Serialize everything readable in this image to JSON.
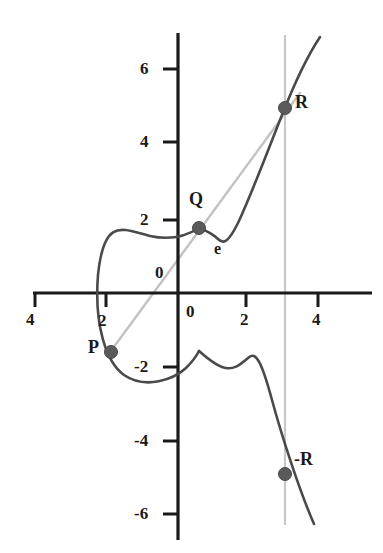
{
  "figure": {
    "kind": "elliptic-curve-point-addition-diagram",
    "background_color": "#ffffff",
    "curve_color": "#4a4a4a",
    "chord_color": "#c2c2c2",
    "vline_color": "#c8c8c8",
    "axis_color": "#1a1a1a",
    "point_color": "#5a5a5a"
  },
  "axes": {
    "x_ticks": [
      {
        "label": "4",
        "value": -4,
        "px": 35,
        "label_px": {
          "x": 26,
          "y": 311
        }
      },
      {
        "label": "2",
        "value": -2,
        "px": 106,
        "label_px": {
          "x": 98,
          "y": 312
        }
      },
      {
        "label": "0",
        "value": 0,
        "px": 178,
        "label_px": {
          "x": 186,
          "y": 303
        }
      },
      {
        "label": "2",
        "value": 2,
        "px": 246,
        "label_px": {
          "x": 240,
          "y": 311
        }
      },
      {
        "label": "4",
        "value": 4,
        "px": 318,
        "label_px": {
          "x": 312,
          "y": 311
        }
      }
    ],
    "y_ticks": [
      {
        "label": "6",
        "value": 6,
        "px": 69,
        "label_px": {
          "x": 140,
          "y": 60
        }
      },
      {
        "label": "4",
        "value": 4,
        "px": 142,
        "label_px": {
          "x": 140,
          "y": 133
        }
      },
      {
        "label": "2",
        "value": 2,
        "px": 220,
        "label_px": {
          "x": 140,
          "y": 211
        }
      },
      {
        "label": "0",
        "value": 0,
        "px": 293,
        "label_px": {
          "x": 155,
          "y": 264
        }
      },
      {
        "label": "-2",
        "value": -2,
        "px": 367,
        "label_px": {
          "x": 134,
          "y": 358
        }
      },
      {
        "label": "-4",
        "value": -4,
        "px": 441,
        "label_px": {
          "x": 134,
          "y": 432
        }
      },
      {
        "label": "-6",
        "value": -6,
        "px": 514,
        "label_px": {
          "x": 134,
          "y": 505
        }
      }
    ],
    "x_axis_pixel_y": 293,
    "y_axis_pixel_x": 178,
    "x_axis_span_px": [
      33,
      372
    ],
    "y_axis_span_px": [
      33,
      540
    ],
    "units_per_px_x": 0.0288,
    "units_per_px_y": 0.0274
  },
  "points": [
    {
      "name": "P",
      "label": "P",
      "px": {
        "x": 111,
        "y": 352
      },
      "value": {
        "x": -1.9,
        "y": -1.6
      },
      "label_px": {
        "x": 88,
        "y": 338
      }
    },
    {
      "name": "Q",
      "label": "Q",
      "px": {
        "x": 199,
        "y": 228
      },
      "value": {
        "x": 0.6,
        "y": 1.78
      },
      "label_px": {
        "x": 189,
        "y": 190
      }
    },
    {
      "name": "R",
      "label": "R",
      "px": {
        "x": 285,
        "y": 108
      },
      "value": {
        "x": 3.0,
        "y": 5.05
      },
      "label_px": {
        "x": 295,
        "y": 93
      }
    },
    {
      "name": "-R",
      "label": "-R",
      "px": {
        "x": 285,
        "y": 474
      },
      "value": {
        "x": 3.0,
        "y": -4.95
      },
      "label_px": {
        "x": 294,
        "y": 450
      }
    }
  ],
  "curve_label": {
    "label": "e",
    "px": {
      "x": 214,
      "y": 241
    }
  },
  "chord": {
    "name": "chord-through-P-Q-R",
    "from_px": {
      "x": 108,
      "y": 355
    },
    "to_px": {
      "x": 300,
      "y": 93
    }
  },
  "vertical_line": {
    "name": "vertical-line-at-x-3",
    "x_px": 285,
    "top_px": 35,
    "bottom_px": 525
  },
  "curve_paths": {
    "oval": "M 199 228 C 185 237 168 240 150 236 C 124 230 104 215 98 275 C 94 325 106 362 124 375 C 146 390 174 379 186 368 C 193 361 197 355 199 351",
    "right_upper": "M 199 228 C 207 231 213 234 218 239 C 224 245 229 241 238 223 C 252 193 268 150 282 115 C 295 82 310 52 320 37",
    "right_lower": "M 199 351 C 208 359 214 364 222 367 C 233 371 240 365 248 358 C 256 350 262 363 272 400 C 282 437 300 492 314 524"
  }
}
